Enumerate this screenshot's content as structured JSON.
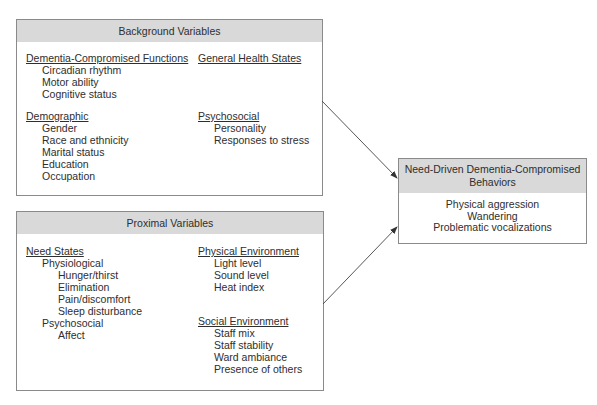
{
  "background_box": {
    "title": "Background Variables",
    "left_column": [
      {
        "text": "Dementia-Compromised Functions",
        "level": 0,
        "heading": true
      },
      {
        "text": "Circadian rhythm",
        "level": 1
      },
      {
        "text": "Motor ability",
        "level": 1
      },
      {
        "text": "Cognitive status",
        "level": 1
      },
      {
        "text": "Demographic",
        "level": 0,
        "heading": true
      },
      {
        "text": "Gender",
        "level": 1
      },
      {
        "text": "Race and ethnicity",
        "level": 1
      },
      {
        "text": "Marital status",
        "level": 1
      },
      {
        "text": "Education",
        "level": 1
      },
      {
        "text": "Occupation",
        "level": 1
      }
    ],
    "right_column": [
      {
        "text": "General Health States",
        "level": 0,
        "heading": true
      },
      {
        "text": "Psychosocial",
        "level": 0,
        "heading": true
      },
      {
        "text": "Personality",
        "level": 1
      },
      {
        "text": "Responses to stress",
        "level": 1
      }
    ]
  },
  "proximal_box": {
    "title": "Proximal Variables",
    "left_column": [
      {
        "text": "Need States",
        "level": 0,
        "heading": true
      },
      {
        "text": "Physiological",
        "level": 1
      },
      {
        "text": "Hunger/thirst",
        "level": 2
      },
      {
        "text": "Elimination",
        "level": 2
      },
      {
        "text": "Pain/discomfort",
        "level": 2
      },
      {
        "text": "Sleep disturbance",
        "level": 2
      },
      {
        "text": "Psychosocial",
        "level": 1
      },
      {
        "text": "Affect",
        "level": 2
      }
    ],
    "right_column": [
      {
        "text": "Physical Environment",
        "level": 0,
        "heading": true
      },
      {
        "text": "Light level",
        "level": 1
      },
      {
        "text": "Sound level",
        "level": 1
      },
      {
        "text": "Heat index",
        "level": 1
      },
      {
        "text": "Social Environment",
        "level": 0,
        "heading": true
      },
      {
        "text": "Staff mix",
        "level": 1
      },
      {
        "text": "Staff stability",
        "level": 1
      },
      {
        "text": "Ward ambiance",
        "level": 1
      },
      {
        "text": "Presence of others",
        "level": 1
      }
    ]
  },
  "outcome_box": {
    "title_line1": "Need-Driven Dementia-Compromised",
    "title_line2": "Behaviors",
    "items": [
      "Physical aggression",
      "Wandering",
      "Problematic vocalizations"
    ]
  },
  "arrows": [
    {
      "from": "Background Variables",
      "to": "Need-Driven Dementia-Compromised Behaviors"
    },
    {
      "from": "Proximal Variables",
      "to": "Need-Driven Dementia-Compromised Behaviors"
    }
  ],
  "colors": {
    "header_fill": "#d9d9d9",
    "border": "#8a8a8a",
    "text": "#2e2e2e"
  }
}
